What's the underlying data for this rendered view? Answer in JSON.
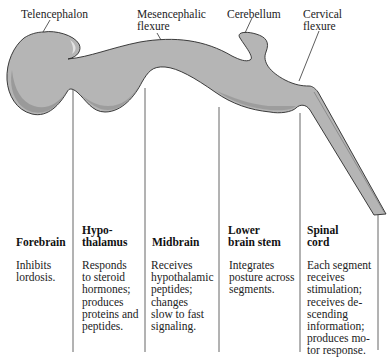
{
  "diagram": {
    "structure_labels": [
      {
        "id": "telencephalon",
        "text": "Telencephalon"
      },
      {
        "id": "mesencephalic-flexure",
        "text": "Mesencephalic\nflexure"
      },
      {
        "id": "cerebellum",
        "text": "Cerebellum"
      },
      {
        "id": "cervical-flexure",
        "text": "Cervical\nflexure"
      }
    ],
    "columns": [
      {
        "title": "Forebrain",
        "description": "Inhibits\nlordosis."
      },
      {
        "title": "Hypo-\nthalamus",
        "description": "Responds\nto steroid\nhormones;\nproduces\nproteins and\npeptides."
      },
      {
        "title": "Midbrain",
        "description": "Receives\nhypothalamic\npeptides;\nchanges\nslow to fast\nsignaling."
      },
      {
        "title": "Lower\nbrain stem",
        "description": "Integrates\nposture across\nsegments."
      },
      {
        "title": "Spinal\ncord",
        "description": "Each segment\nreceives\nstimulation;\nreceives de-\nscending\ninformation;\nproduces mo-\ntor response."
      }
    ],
    "colors": {
      "tissue_fill": "#b5b5b5",
      "tissue_shadow": "#8e8e8e",
      "tissue_highlight": "#d6d6d6",
      "outline": "#2a2a2a",
      "divider": "#555555"
    }
  }
}
